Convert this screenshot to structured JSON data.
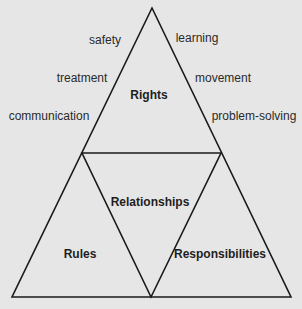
{
  "diagram": {
    "type": "triangle-of-triangles",
    "background": "#e6e6e6",
    "line_color": "#1a1a1a",
    "sections": {
      "top": {
        "label": "Rights"
      },
      "center": {
        "label": "Relationships"
      },
      "bottom_left": {
        "label": "Rules"
      },
      "bottom_right": {
        "label": "Responsibilities"
      }
    },
    "rights_left_items": [
      "safety",
      "treatment",
      "communication"
    ],
    "rights_right_items": [
      "learning",
      "movement",
      "problem-solving"
    ]
  }
}
